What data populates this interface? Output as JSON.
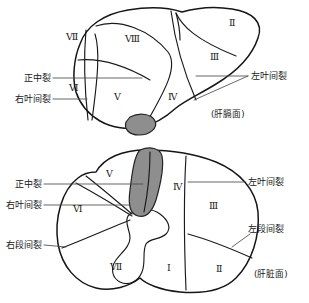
{
  "figure": {
    "panels": [
      {
        "id": "upper",
        "caption": "(肝膈面)",
        "segments": [
          {
            "id": "u-7",
            "label": "Ⅶ",
            "x": 66,
            "y": 40
          },
          {
            "id": "u-8",
            "label": "Ⅷ",
            "x": 125,
            "y": 42
          },
          {
            "id": "u-2",
            "label": "Ⅱ",
            "x": 229,
            "y": 26
          },
          {
            "id": "u-3",
            "label": "Ⅲ",
            "x": 210,
            "y": 60
          },
          {
            "id": "u-6",
            "label": "Ⅵ",
            "x": 69,
            "y": 91
          },
          {
            "id": "u-5",
            "label": "Ⅴ",
            "x": 114,
            "y": 100
          },
          {
            "id": "u-4",
            "label": "Ⅳ",
            "x": 168,
            "y": 100
          }
        ],
        "annotations": [
          {
            "id": "u-median-fissure",
            "label": "正中裂",
            "x": 26,
            "y": 81,
            "align": "left"
          },
          {
            "id": "u-right-interlobar",
            "label": "右叶间裂",
            "x": 16,
            "y": 102,
            "align": "left"
          },
          {
            "id": "u-left-interlobar",
            "label": "左叶间裂",
            "x": 250,
            "y": 79,
            "align": "left"
          }
        ]
      },
      {
        "id": "lower",
        "caption": "(肝脏面)",
        "segments": [
          {
            "id": "l-5",
            "label": "Ⅴ",
            "x": 106,
            "y": 177
          },
          {
            "id": "l-4",
            "label": "Ⅳ",
            "x": 173,
            "y": 190
          },
          {
            "id": "l-6",
            "label": "Ⅵ",
            "x": 73,
            "y": 212
          },
          {
            "id": "l-3",
            "label": "Ⅲ",
            "x": 209,
            "y": 209
          },
          {
            "id": "l-7",
            "label": "Ⅶ",
            "x": 110,
            "y": 270
          },
          {
            "id": "l-1",
            "label": "Ⅰ",
            "x": 167,
            "y": 271
          },
          {
            "id": "l-2",
            "label": "Ⅱ",
            "x": 216,
            "y": 272
          }
        ],
        "annotations": [
          {
            "id": "l-median-fissure",
            "label": "正中裂",
            "x": 16,
            "y": 187,
            "align": "left"
          },
          {
            "id": "l-right-interlobar",
            "label": "右叶间裂",
            "x": 6,
            "y": 208,
            "align": "left"
          },
          {
            "id": "l-right-intersegment",
            "label": "右段间裂",
            "x": 6,
            "y": 248,
            "align": "left"
          },
          {
            "id": "l-left-interlobar",
            "label": "左叶间裂",
            "x": 247,
            "y": 185,
            "align": "left"
          },
          {
            "id": "l-left-intersegment",
            "label": "左段间裂",
            "x": 247,
            "y": 232,
            "align": "left"
          }
        ]
      }
    ],
    "colors": {
      "outline": "#151515",
      "fissure": "#1a1a1a",
      "shaded": "#8e8e8e",
      "leader": "#4a4a4a",
      "background": "#ffffff"
    }
  }
}
